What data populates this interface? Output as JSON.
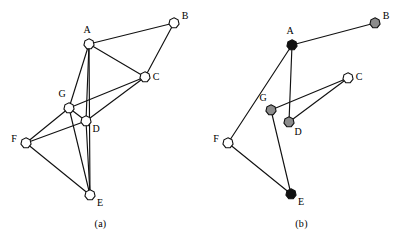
{
  "figure": {
    "panels": [
      {
        "id": "a",
        "caption": "(a)",
        "nodes": [
          {
            "id": "A",
            "label": "A",
            "x": 89,
            "y": 44,
            "fill": "#ffffff",
            "label_dx": -2,
            "label_dy": -11
          },
          {
            "id": "B",
            "label": "B",
            "x": 174,
            "y": 23,
            "fill": "#ffffff",
            "label_dx": 11,
            "label_dy": -4
          },
          {
            "id": "C",
            "label": "C",
            "x": 145,
            "y": 77,
            "fill": "#ffffff",
            "label_dx": 11,
            "label_dy": 3
          },
          {
            "id": "D",
            "label": "D",
            "x": 86,
            "y": 121,
            "fill": "#ffffff",
            "label_dx": 10,
            "label_dy": 11
          },
          {
            "id": "E",
            "label": "E",
            "x": 90,
            "y": 195,
            "fill": "#ffffff",
            "label_dx": 10,
            "label_dy": 11
          },
          {
            "id": "F",
            "label": "F",
            "x": 26,
            "y": 143,
            "fill": "#ffffff",
            "label_dx": -12,
            "label_dy": -1
          },
          {
            "id": "G",
            "label": "G",
            "x": 69,
            "y": 108,
            "fill": "#ffffff",
            "label_dx": -7,
            "label_dy": -11
          }
        ],
        "edges": [
          [
            "A",
            "B"
          ],
          [
            "A",
            "C"
          ],
          [
            "A",
            "G"
          ],
          [
            "A",
            "D"
          ],
          [
            "A",
            "E"
          ],
          [
            "B",
            "C"
          ],
          [
            "C",
            "G"
          ],
          [
            "C",
            "D"
          ],
          [
            "G",
            "D"
          ],
          [
            "G",
            "F"
          ],
          [
            "G",
            "E"
          ],
          [
            "D",
            "F"
          ],
          [
            "D",
            "E"
          ],
          [
            "F",
            "E"
          ]
        ]
      },
      {
        "id": "b",
        "caption": "(b)",
        "nodes": [
          {
            "id": "A",
            "label": "A",
            "x": 91,
            "y": 45,
            "fill": "#111111",
            "label_dx": -2,
            "label_dy": -11
          },
          {
            "id": "B",
            "label": "B",
            "x": 174,
            "y": 23,
            "fill": "#8c8c8c",
            "label_dx": 11,
            "label_dy": -4
          },
          {
            "id": "C",
            "label": "C",
            "x": 147,
            "y": 78,
            "fill": "#ffffff",
            "label_dx": 11,
            "label_dy": 2
          },
          {
            "id": "D",
            "label": "D",
            "x": 88,
            "y": 122,
            "fill": "#8c8c8c",
            "label_dx": 9,
            "label_dy": 13
          },
          {
            "id": "E",
            "label": "E",
            "x": 90,
            "y": 194,
            "fill": "#111111",
            "label_dx": 10,
            "label_dy": 11
          },
          {
            "id": "F",
            "label": "F",
            "x": 27,
            "y": 143,
            "fill": "#ffffff",
            "label_dx": -12,
            "label_dy": -1
          },
          {
            "id": "G",
            "label": "G",
            "x": 70,
            "y": 110,
            "fill": "#8c8c8c",
            "label_dx": -8,
            "label_dy": -9
          }
        ],
        "edges": [
          [
            "A",
            "B"
          ],
          [
            "A",
            "F"
          ],
          [
            "A",
            "D"
          ],
          [
            "G",
            "C"
          ],
          [
            "D",
            "C"
          ],
          [
            "G",
            "E"
          ],
          [
            "F",
            "E"
          ]
        ]
      }
    ],
    "colors": {
      "edge": "#111111",
      "node_stroke": "#111111",
      "fill_white": "#ffffff",
      "fill_gray": "#8c8c8c",
      "fill_black": "#111111",
      "background": "#ffffff"
    },
    "node_radius": 5.2
  }
}
